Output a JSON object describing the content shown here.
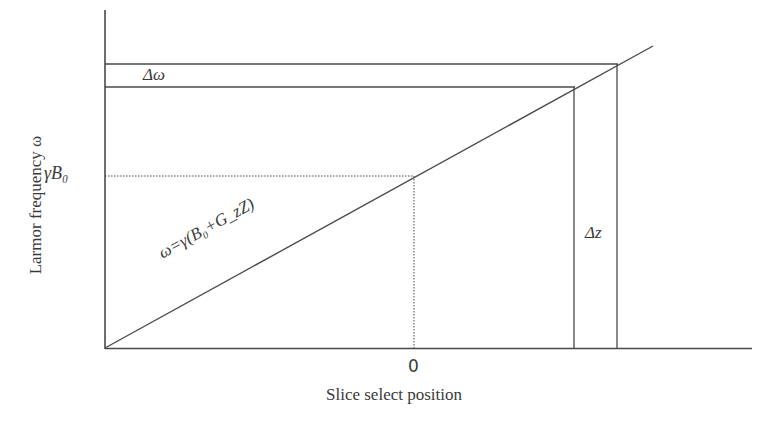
{
  "diagram": {
    "type": "line-relationship",
    "title": "",
    "y_axis_label": "Larmor frequency ω",
    "x_axis_label": "Slice select position",
    "x_tick_zero": "0",
    "y_tick_b0": "γB₀",
    "equation": "ω=γ(B₀+G_zZ)",
    "delta_omega": "Δω",
    "delta_z": "Δz",
    "colors": {
      "line": "#4a4a4a",
      "background": "#ffffff"
    }
  }
}
